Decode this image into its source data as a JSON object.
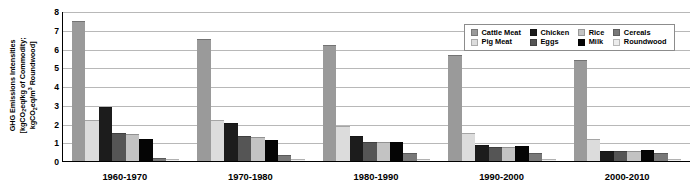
{
  "chart_data": {
    "type": "bar",
    "title": "",
    "xlabel": "",
    "ylabel_line1": "GHG Emissions Intensities",
    "ylabel_line2_pre": "[kgCO",
    "ylabel_line2_sub": "2",
    "ylabel_line2_mid": "eq/kg of Commodity;",
    "ylabel_line3_pre": "kgCO",
    "ylabel_line3_sub": "2",
    "ylabel_line3_mid": "eq/m",
    "ylabel_line3_sup": "3",
    "ylabel_line3_post": " Roundwood]",
    "ylim": [
      0,
      8
    ],
    "yticks": [
      8,
      7,
      6,
      5,
      4,
      3,
      2,
      1,
      0
    ],
    "grid": true,
    "legend_position": "top-right",
    "categories": [
      "1960-1970",
      "1970-1980",
      "1980-1990",
      "1990-2000",
      "2000-2010"
    ],
    "series": [
      {
        "name": "Cattle Meat",
        "color": "#9a9a9a",
        "values": [
          7.45,
          6.5,
          6.2,
          5.65,
          5.4
        ]
      },
      {
        "name": "Pig Meat",
        "color": "#dcdcdc",
        "values": [
          2.2,
          2.2,
          1.85,
          1.5,
          1.2
        ]
      },
      {
        "name": "Chicken",
        "color": "#1c1c1c",
        "values": [
          2.9,
          2.05,
          1.35,
          0.85,
          0.55
        ]
      },
      {
        "name": "Eggs",
        "color": "#555555",
        "values": [
          1.5,
          1.35,
          1.0,
          0.75,
          0.55
        ]
      },
      {
        "name": "Rice",
        "color": "#c3c3c3",
        "values": [
          1.45,
          1.3,
          1.0,
          0.75,
          0.55
        ]
      },
      {
        "name": "Milk",
        "color": "#050505",
        "values": [
          1.15,
          1.1,
          1.0,
          0.8,
          0.6
        ]
      },
      {
        "name": "Cereals",
        "color": "#787878",
        "values": [
          0.15,
          0.3,
          0.45,
          0.45,
          0.45
        ]
      },
      {
        "name": "Roundwood",
        "color": "#ececec",
        "values": [
          0.1,
          0.1,
          0.1,
          0.1,
          0.1
        ]
      }
    ]
  }
}
